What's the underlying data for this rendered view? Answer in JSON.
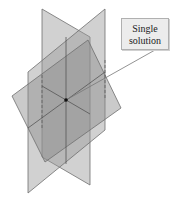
{
  "diagram": {
    "type": "three-planes-intersection",
    "callout": {
      "line1": "Single",
      "line2": "solution"
    },
    "colors": {
      "plane_fill": "#9a9a9a",
      "plane_edge": "#6e6e6e",
      "point": "#111111",
      "callout_bg": "#ececec"
    }
  }
}
